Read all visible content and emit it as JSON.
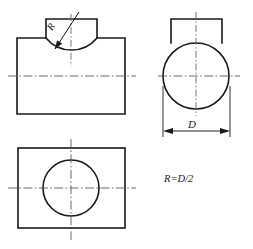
{
  "drawing": {
    "title": "Engineering orthographic projection of a cylindrical part with rectangular boss",
    "background_color": "#ffffff",
    "line_color": "#1a1a1a",
    "centerline_color": "#5a5a5a",
    "views": {
      "front": {
        "name": "front-view",
        "body": {
          "x": 17,
          "y": 38,
          "width": 108,
          "height": 76
        },
        "boss": {
          "x": 46,
          "y": 19,
          "width": 51,
          "height": 19
        },
        "arc_label": "R"
      },
      "side": {
        "name": "side-view",
        "circle": {
          "cx": 196,
          "cy": 76,
          "r": 33
        },
        "boss": {
          "x": 171,
          "y": 19,
          "width": 51,
          "height": 24
        },
        "dimension_label": "D"
      },
      "top": {
        "name": "top-view",
        "body": {
          "x": 18,
          "y": 148,
          "width": 107,
          "height": 80
        },
        "circle": {
          "cx": 71,
          "cy": 188,
          "r": 28
        }
      }
    },
    "annotations": {
      "radius_label": "R",
      "diameter_label": "D",
      "relation_note": "R=D/2"
    }
  }
}
